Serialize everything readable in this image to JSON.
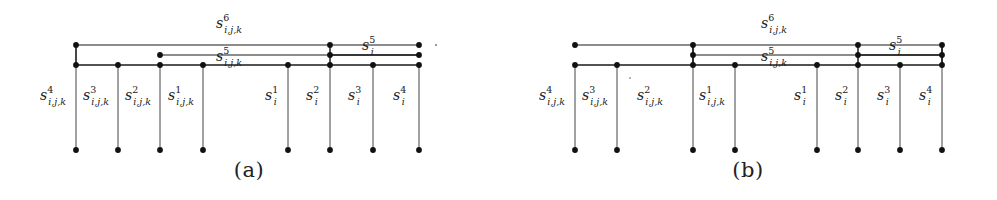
{
  "figure": {
    "type": "diagram",
    "background_color": "#ffffff",
    "line_color": "#1a1a1a",
    "dot_color": "#111111"
  },
  "panels": [
    {
      "id": "a",
      "caption": "(a)",
      "top_labels": [
        {
          "name": "s6-label",
          "base": "s",
          "sup": "6",
          "sub": "i,j,k"
        },
        {
          "name": "s5-ijk-label",
          "base": "s",
          "sup": "5",
          "sub": "i,j,k"
        },
        {
          "name": "s5-i-label",
          "base": "s",
          "sup": "5",
          "sub": "i"
        }
      ],
      "column_labels": [
        {
          "name": "s4-ijk-label",
          "base": "s",
          "sup": "4",
          "sub": "i,j,k"
        },
        {
          "name": "s3-ijk-label",
          "base": "s",
          "sup": "3",
          "sub": "i,j,k"
        },
        {
          "name": "s2-ijk-label",
          "base": "s",
          "sup": "2",
          "sub": "i,j,k"
        },
        {
          "name": "s1-ijk-label",
          "base": "s",
          "sup": "1",
          "sub": "i,j,k"
        },
        {
          "name": "s1-i-label",
          "base": "s",
          "sup": "1",
          "sub": "i"
        },
        {
          "name": "s2-i-label",
          "base": "s",
          "sup": "2",
          "sub": "i"
        },
        {
          "name": "s3-i-label",
          "base": "s",
          "sup": "3",
          "sub": "i"
        },
        {
          "name": "s4-i-label",
          "base": "s",
          "sup": "4",
          "sub": "i"
        }
      ]
    },
    {
      "id": "b",
      "caption": "(b)",
      "top_labels": [
        {
          "name": "s6-label",
          "base": "s",
          "sup": "6",
          "sub": "i,j,k"
        },
        {
          "name": "s5-ijk-label",
          "base": "s",
          "sup": "5",
          "sub": "i,j,k"
        },
        {
          "name": "s5-i-label",
          "base": "s",
          "sup": "5",
          "sub": "i"
        }
      ],
      "column_labels": [
        {
          "name": "s4-ijk-label",
          "base": "s",
          "sup": "4",
          "sub": "i,j,k"
        },
        {
          "name": "s3-ijk-label",
          "base": "s",
          "sup": "3",
          "sub": "i,j,k"
        },
        {
          "name": "s2-ijk-label",
          "base": "s",
          "sup": "2",
          "sub": "i,j,k"
        },
        {
          "name": "s1-ijk-label",
          "base": "s",
          "sup": "1",
          "sub": "i,j,k"
        },
        {
          "name": "s1-i-label",
          "base": "s",
          "sup": "1",
          "sub": "i"
        },
        {
          "name": "s2-i-label",
          "base": "s",
          "sup": "2",
          "sub": "i"
        },
        {
          "name": "s3-i-label",
          "base": "s",
          "sup": "3",
          "sub": "i"
        },
        {
          "name": "s4-i-label",
          "base": "s",
          "sup": "4",
          "sub": "i"
        }
      ]
    }
  ]
}
